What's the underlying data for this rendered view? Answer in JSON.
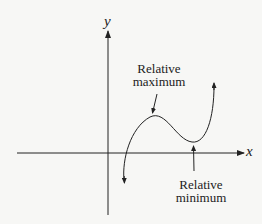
{
  "axes": {
    "x_label": "x",
    "y_label": "y"
  },
  "annotations": {
    "max_line1": "Relative",
    "max_line2": "maximum",
    "min_line1": "Relative",
    "min_line2": "minimum"
  },
  "colors": {
    "ink": "#222222",
    "background": "#f7f7f5"
  }
}
